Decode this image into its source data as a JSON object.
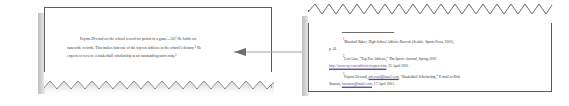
{
  "figure": {
    "type": "citation-link-illustration",
    "accent_color": "#5b5b5b",
    "link_color": "#4a4a8c"
  },
  "left_page": {
    "name": "body-text-page",
    "paragraph_lines": [
      "Payton Devoud set the school record for points in a game—50.¹ He holds six",
      "statewide records.  This makes him one of the top ten athletes in the school’s history.²  He",
      "expects to receive a basketball scholarship at an outstanding university.³"
    ]
  },
  "right_page": {
    "name": "footnotes-page",
    "notes": [
      {
        "marker": "1",
        "text_before_italic": "Marshall Baker, ",
        "italic": "High School Athletic Records",
        "text_after_italic": " (Seattle: Sports Press, 2001),",
        "continuation": "p. 41."
      },
      {
        "marker": "2",
        "text_before_italic": "Lori Gun, “Top Ten Athletes,” ",
        "italic": "The Sports Journal",
        "text_after_italic": ", Spring 2001",
        "link": "http://www.tsj.com/athletics/topten.htm",
        "continuation_after_link": ", 25 April 2001."
      },
      {
        "marker": "3",
        "text_before_italic": "Payton Devoud, ",
        "link": "pdevoud@tmail.com",
        "text_after_italic": ", “Basketball Scholarship,” E-mail to Kirk",
        "continuation": "Stanton, ",
        "continuation_link": "kstanton@tmail.com",
        "continuation_after_link": ", 17 April 2001."
      }
    ]
  },
  "connector": {
    "name": "citation-link-arrow",
    "style": "double-headed",
    "color": "#8a8a8a"
  }
}
